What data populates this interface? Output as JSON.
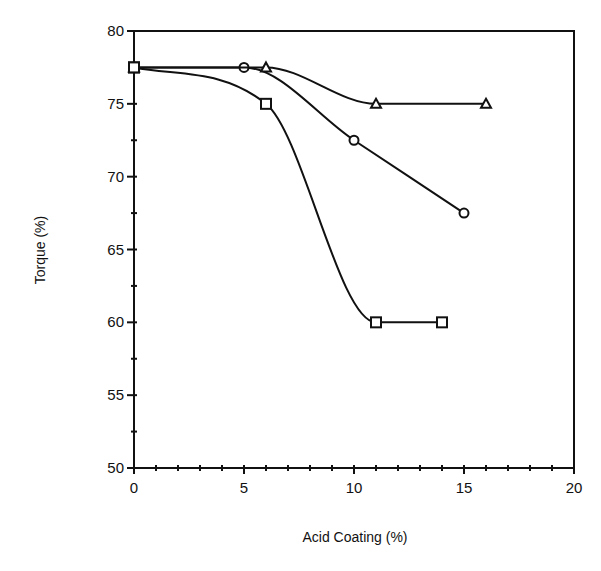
{
  "chart_data": {
    "type": "line",
    "title": "",
    "xlabel": "Acid Coating (%)",
    "ylabel": "Torque (%)",
    "xlim": [
      0,
      20
    ],
    "ylim": [
      50,
      80
    ],
    "x_ticks": [
      0,
      5,
      10,
      15,
      20
    ],
    "y_ticks": [
      50,
      55,
      60,
      65,
      70,
      75,
      80
    ],
    "x_minor_step": 1,
    "y_minor_step": 2.5,
    "grid": false,
    "legend": null,
    "series": [
      {
        "name": "square",
        "marker": "square",
        "smooth": true,
        "x": [
          0,
          6,
          11,
          14
        ],
        "y": [
          77.5,
          75,
          60,
          60
        ]
      },
      {
        "name": "circle",
        "marker": "circle",
        "smooth": true,
        "x": [
          0,
          5,
          10,
          15
        ],
        "y": [
          77.5,
          77.5,
          72.5,
          67.5
        ]
      },
      {
        "name": "triangle",
        "marker": "triangle",
        "smooth": true,
        "x": [
          0,
          6,
          11,
          16
        ],
        "y": [
          77.5,
          77.5,
          75,
          75
        ]
      }
    ]
  },
  "style": {
    "line_color": "#111111",
    "background": "#ffffff"
  }
}
